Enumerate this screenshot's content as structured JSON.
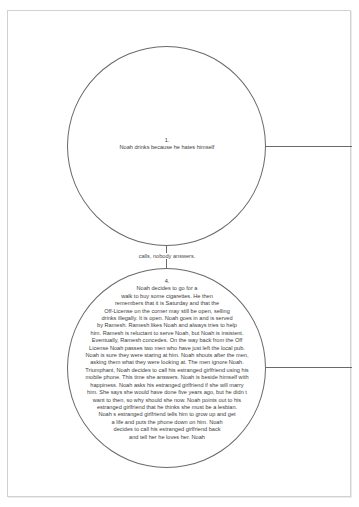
{
  "nodes": [
    {
      "number": "1.",
      "text": "Noah drinks because he hates himself"
    },
    {
      "number": "4.",
      "lines": [
        "Noah decides to go for a",
        "walk to buy some cigarettes. He then",
        "remembers that it is Saturday and that the",
        "Off-License on the corner may still be open, selling",
        "drinks illegally. It is open. Noah goes in and is served",
        "by Ramesh. Ramesh likes Noah and always tries to help",
        "him. Ramesh is reluctant to serve Noah, but Noah is insistent.",
        "Eventually, Ramesh concedes. On the way back from the Off",
        "License Noah passes two men who have just left the local pub.",
        "Noah is sure they were staring at him. Noah shouts after the men,",
        "asking them what they were looking at. The men ignore Noah.",
        "Triumphant, Noah decides to call his estranged girlfriend using his",
        "mobile phone. This time she answers. Noah is beside himself with",
        "happiness. Noah asks his estranged girlfriend if she will marry",
        "him. She says she would have done five years ago, but he didn t",
        "want to then, so why should she now. Noah points out to his",
        "estranged girlfriend that he thinks she must be a lesbian.",
        "Noah s estranged girlfriend tells him to grow up and get",
        "a life and puts the phone down on him. Noah",
        "decides to call his estranged girlfriend back",
        "and tell her he loves her. Noah"
      ]
    }
  ],
  "connector": {
    "label": "calls, nobody answers."
  },
  "colors": {
    "line": "#6a6a6a",
    "text": "#3e3e3e",
    "page_border": "#d2d2d2",
    "background": "#ffffff"
  }
}
